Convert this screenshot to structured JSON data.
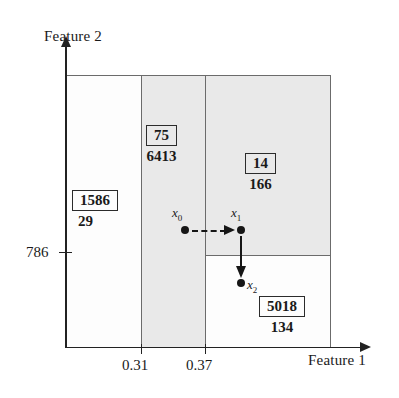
{
  "figure": {
    "type": "decision-tree-partition-diagram",
    "xlabel": "Feature 1",
    "ylabel": "Feature 2"
  },
  "axes": {
    "x_ticks": [
      {
        "label": "0.31",
        "value": 0.31
      },
      {
        "label": "0.37",
        "value": 0.37
      }
    ],
    "y_ticks": [
      {
        "label": "786",
        "value": 786
      }
    ]
  },
  "chart_data": {
    "type": "scatter",
    "title": "",
    "xlabel": "Feature 1",
    "ylabel": "Feature 2",
    "x_tick_labels": [
      "0.31",
      "0.37"
    ],
    "y_tick_labels": [
      "786"
    ],
    "grid": false,
    "legend": "none",
    "regions": [
      {
        "name": "left",
        "node_id": "1586",
        "count": "29",
        "shaded": false,
        "x_range": [
          "min",
          0.31
        ],
        "y_range": [
          "min",
          "max"
        ]
      },
      {
        "name": "middle",
        "node_id": "75",
        "count": "6413",
        "shaded": true,
        "x_range": [
          0.31,
          0.37
        ],
        "y_range": [
          "min",
          "max"
        ]
      },
      {
        "name": "right-top",
        "node_id": "14",
        "count": "166",
        "shaded": true,
        "x_range": [
          0.37,
          "max"
        ],
        "y_range": [
          786,
          "max"
        ]
      },
      {
        "name": "right-bottom",
        "node_id": "5018",
        "count": "134",
        "shaded": false,
        "x_range": [
          0.37,
          "max"
        ],
        "y_range": [
          "min",
          786
        ]
      }
    ],
    "points": [
      {
        "name": "x0",
        "label": "x",
        "sub": "0",
        "region": "middle"
      },
      {
        "name": "x1",
        "label": "x",
        "sub": "1",
        "region": "right-top"
      },
      {
        "name": "x2",
        "label": "x",
        "sub": "2",
        "region": "right-bottom"
      }
    ],
    "arrows": [
      {
        "from": "x0",
        "to": "x1",
        "style": "dashed",
        "direction": "right"
      },
      {
        "from": "x1",
        "to": "x2",
        "style": "solid",
        "direction": "down"
      }
    ]
  },
  "annotations": {
    "node_1586": {
      "id": "1586",
      "count": "29"
    },
    "node_75": {
      "id": "75",
      "count": "6413"
    },
    "node_14": {
      "id": "14",
      "count": "166"
    },
    "node_5018": {
      "id": "5018",
      "count": "134"
    }
  },
  "colors": {
    "shaded_region": "#e9e9e9",
    "unshaded_region": "#fdfdfd",
    "partition_line": "#6b6b6b",
    "axis": "#222222",
    "ink": "#161616"
  }
}
